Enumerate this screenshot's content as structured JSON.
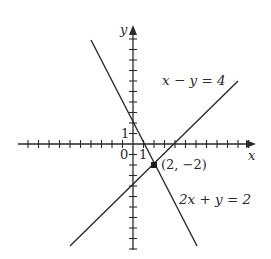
{
  "diagram": {
    "type": "coordinate-plane-linear-system",
    "axes": {
      "x_label": "x",
      "y_label": "y",
      "origin_label": "0",
      "x_unit_label": "1",
      "y_unit_label": "1",
      "x_range": [
        -10,
        11
      ],
      "y_range": [
        -10,
        10
      ]
    },
    "lines": [
      {
        "equation": "x − y = 4",
        "label": "x − y = 4",
        "slope": 1,
        "intercept": -4
      },
      {
        "equation": "2x + y = 2",
        "label": "2x + y = 2",
        "slope": -2,
        "intercept": 2
      }
    ],
    "intersection": {
      "label": "(2, −2)",
      "x": 2,
      "y": -2
    },
    "colors": {
      "ink": "#2a2a2a",
      "background": "#ffffff"
    }
  }
}
